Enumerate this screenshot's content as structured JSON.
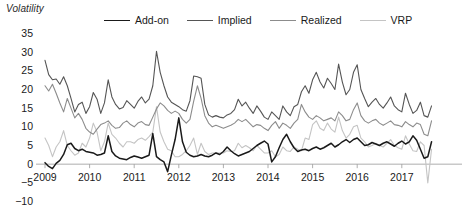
{
  "chart_data": {
    "type": "line",
    "title": "",
    "ylabel": "Volatility",
    "xlabel": "",
    "ylim": [
      -10,
      35
    ],
    "xlim": [
      2009.0,
      2017.75
    ],
    "yticks": [
      35,
      30,
      25,
      20,
      15,
      10,
      5,
      0,
      -5,
      -10
    ],
    "xticks": [
      2009,
      2010,
      2011,
      2012,
      2013,
      2014,
      2015,
      2016,
      2017
    ],
    "grid": false,
    "legend_position": "top",
    "zero_line": true,
    "colors": {
      "add_on": "#1a1a1a",
      "implied": "#555555",
      "realized": "#8c8c8c",
      "vrp": "#c4c4c4",
      "axis": "#999999",
      "text": "#1a1a1a"
    },
    "x": [
      2009.0,
      2009.083,
      2009.167,
      2009.25,
      2009.333,
      2009.417,
      2009.5,
      2009.583,
      2009.667,
      2009.75,
      2009.833,
      2009.917,
      2010.0,
      2010.083,
      2010.167,
      2010.25,
      2010.333,
      2010.417,
      2010.5,
      2010.583,
      2010.667,
      2010.75,
      2010.833,
      2010.917,
      2011.0,
      2011.083,
      2011.167,
      2011.25,
      2011.333,
      2011.417,
      2011.5,
      2011.583,
      2011.667,
      2011.75,
      2011.833,
      2011.917,
      2012.0,
      2012.083,
      2012.167,
      2012.25,
      2012.333,
      2012.417,
      2012.5,
      2012.583,
      2012.667,
      2012.75,
      2012.833,
      2012.917,
      2013.0,
      2013.083,
      2013.167,
      2013.25,
      2013.333,
      2013.417,
      2013.5,
      2013.583,
      2013.667,
      2013.75,
      2013.833,
      2013.917,
      2014.0,
      2014.083,
      2014.167,
      2014.25,
      2014.333,
      2014.417,
      2014.5,
      2014.583,
      2014.667,
      2014.75,
      2014.833,
      2014.917,
      2015.0,
      2015.083,
      2015.167,
      2015.25,
      2015.333,
      2015.417,
      2015.5,
      2015.583,
      2015.667,
      2015.75,
      2015.833,
      2015.917,
      2016.0,
      2016.083,
      2016.167,
      2016.25,
      2016.333,
      2016.417,
      2016.5,
      2016.583,
      2016.667,
      2016.75,
      2016.833,
      2016.917,
      2017.0,
      2017.083,
      2017.167,
      2017.25,
      2017.333,
      2017.417,
      2017.5,
      2017.583,
      2017.667
    ],
    "series": [
      {
        "name": "Add-on",
        "color": "#1a1a1a",
        "width": 1.5,
        "values": [
          0.4,
          -0.6,
          -1.2,
          0.2,
          1.0,
          2.6,
          5.2,
          5.6,
          4.2,
          3.6,
          4.0,
          3.4,
          3.2,
          3.0,
          2.4,
          2.6,
          3.0,
          7.6,
          3.4,
          2.2,
          1.6,
          1.4,
          1.2,
          1.8,
          2.2,
          1.9,
          1.6,
          2.0,
          2.4,
          8.2,
          2.0,
          1.2,
          0.6,
          -2.0,
          2.4,
          6.6,
          12.4,
          6.0,
          3.2,
          2.4,
          2.0,
          2.2,
          2.6,
          2.2,
          2.0,
          2.4,
          3.0,
          2.6,
          3.4,
          4.6,
          3.6,
          2.8,
          2.2,
          2.6,
          3.0,
          3.4,
          4.2,
          5.0,
          5.6,
          6.2,
          5.4,
          0.6,
          2.0,
          4.4,
          6.6,
          8.0,
          6.0,
          4.4,
          3.4,
          3.8,
          4.0,
          3.6,
          4.2,
          4.6,
          4.0,
          4.4,
          5.0,
          5.6,
          4.6,
          5.2,
          6.0,
          6.6,
          5.8,
          6.6,
          7.0,
          6.0,
          5.0,
          5.2,
          5.8,
          5.4,
          5.0,
          5.6,
          6.0,
          5.4,
          4.8,
          5.6,
          6.2,
          5.4,
          6.0,
          7.6,
          6.4,
          4.0,
          1.6,
          2.0,
          6.0
        ]
      },
      {
        "name": "Implied",
        "color": "#555555",
        "width": 1.1,
        "values": [
          27.8,
          24.0,
          22.6,
          22.8,
          21.4,
          23.4,
          21.0,
          17.6,
          14.0,
          16.0,
          16.6,
          13.6,
          15.4,
          19.2,
          17.4,
          13.6,
          16.4,
          22.6,
          18.0,
          16.0,
          14.8,
          15.2,
          17.0,
          16.0,
          15.0,
          16.8,
          18.0,
          16.4,
          17.4,
          21.0,
          30.2,
          24.6,
          21.0,
          18.0,
          16.6,
          16.0,
          15.4,
          14.6,
          14.2,
          17.0,
          23.6,
          23.4,
          23.0,
          16.0,
          13.2,
          12.6,
          13.0,
          12.6,
          12.4,
          13.2,
          13.6,
          14.6,
          17.4,
          15.6,
          16.6,
          15.0,
          13.6,
          15.6,
          14.2,
          12.6,
          12.0,
          14.0,
          13.0,
          12.0,
          15.6,
          14.0,
          13.0,
          15.4,
          16.0,
          19.4,
          21.0,
          19.0,
          22.6,
          24.6,
          22.0,
          20.4,
          23.0,
          21.6,
          20.0,
          26.8,
          22.0,
          18.6,
          20.0,
          24.6,
          26.6,
          20.0,
          17.6,
          15.4,
          16.6,
          17.6,
          16.0,
          15.0,
          16.4,
          18.0,
          15.6,
          14.6,
          14.0,
          19.0,
          16.0,
          13.6,
          14.4,
          16.6,
          13.0,
          12.6,
          15.6
        ]
      },
      {
        "name": "Realized",
        "color": "#8c8c8c",
        "width": 1.1,
        "values": [
          21.0,
          19.6,
          21.4,
          19.0,
          16.4,
          14.0,
          17.6,
          15.0,
          12.4,
          13.6,
          12.0,
          9.6,
          8.6,
          8.0,
          9.4,
          10.6,
          11.0,
          11.6,
          10.4,
          9.6,
          9.8,
          11.0,
          11.6,
          10.6,
          10.0,
          11.0,
          11.4,
          10.6,
          10.4,
          12.6,
          14.8,
          16.4,
          15.6,
          14.4,
          13.6,
          14.2,
          13.6,
          12.0,
          11.0,
          12.0,
          16.8,
          21.0,
          17.6,
          13.0,
          11.0,
          10.0,
          10.4,
          10.0,
          9.6,
          10.0,
          10.4,
          11.0,
          12.0,
          11.4,
          12.0,
          11.0,
          10.0,
          10.6,
          10.4,
          9.6,
          9.0,
          10.4,
          11.4,
          9.6,
          11.0,
          10.4,
          9.6,
          11.0,
          12.0,
          16.0,
          14.0,
          12.6,
          12.0,
          13.0,
          12.4,
          11.6,
          12.0,
          12.4,
          11.6,
          14.0,
          13.0,
          11.6,
          12.0,
          14.6,
          16.4,
          13.0,
          11.6,
          11.0,
          11.6,
          12.0,
          11.0,
          10.4,
          11.0,
          11.6,
          10.6,
          10.4,
          10.0,
          11.4,
          10.6,
          10.0,
          11.0,
          10.6,
          8.0,
          7.6,
          11.6
        ]
      },
      {
        "name": "VRP",
        "color": "#c4c4c4",
        "width": 1.1,
        "values": [
          7.0,
          5.0,
          2.0,
          4.6,
          6.0,
          9.0,
          5.0,
          3.6,
          2.4,
          3.0,
          5.6,
          4.6,
          7.0,
          11.0,
          8.6,
          3.6,
          6.0,
          11.0,
          8.0,
          7.0,
          5.6,
          4.6,
          6.0,
          6.0,
          5.6,
          6.6,
          7.0,
          6.4,
          7.4,
          8.6,
          15.4,
          8.6,
          6.0,
          4.0,
          3.6,
          2.0,
          2.0,
          2.6,
          3.6,
          5.0,
          7.0,
          2.6,
          5.6,
          3.4,
          2.6,
          3.0,
          3.0,
          3.0,
          3.0,
          3.6,
          3.4,
          3.6,
          5.6,
          4.4,
          5.0,
          4.4,
          3.6,
          5.0,
          4.0,
          3.0,
          3.0,
          3.6,
          2.0,
          2.6,
          4.6,
          3.6,
          3.4,
          4.6,
          4.0,
          3.6,
          7.0,
          6.6,
          10.6,
          11.6,
          9.6,
          9.0,
          11.0,
          9.4,
          8.6,
          12.6,
          9.0,
          7.0,
          8.0,
          10.0,
          10.4,
          7.0,
          6.0,
          4.6,
          5.0,
          5.6,
          5.0,
          4.6,
          5.6,
          6.6,
          5.0,
          4.4,
          4.0,
          7.6,
          5.4,
          3.6,
          3.4,
          6.0,
          5.0,
          -5.0,
          4.0
        ]
      }
    ]
  },
  "legend": {
    "items": [
      {
        "label": "Add-on"
      },
      {
        "label": "Implied"
      },
      {
        "label": "Realized"
      },
      {
        "label": "VRP"
      }
    ]
  },
  "axis_title": "Volatility"
}
